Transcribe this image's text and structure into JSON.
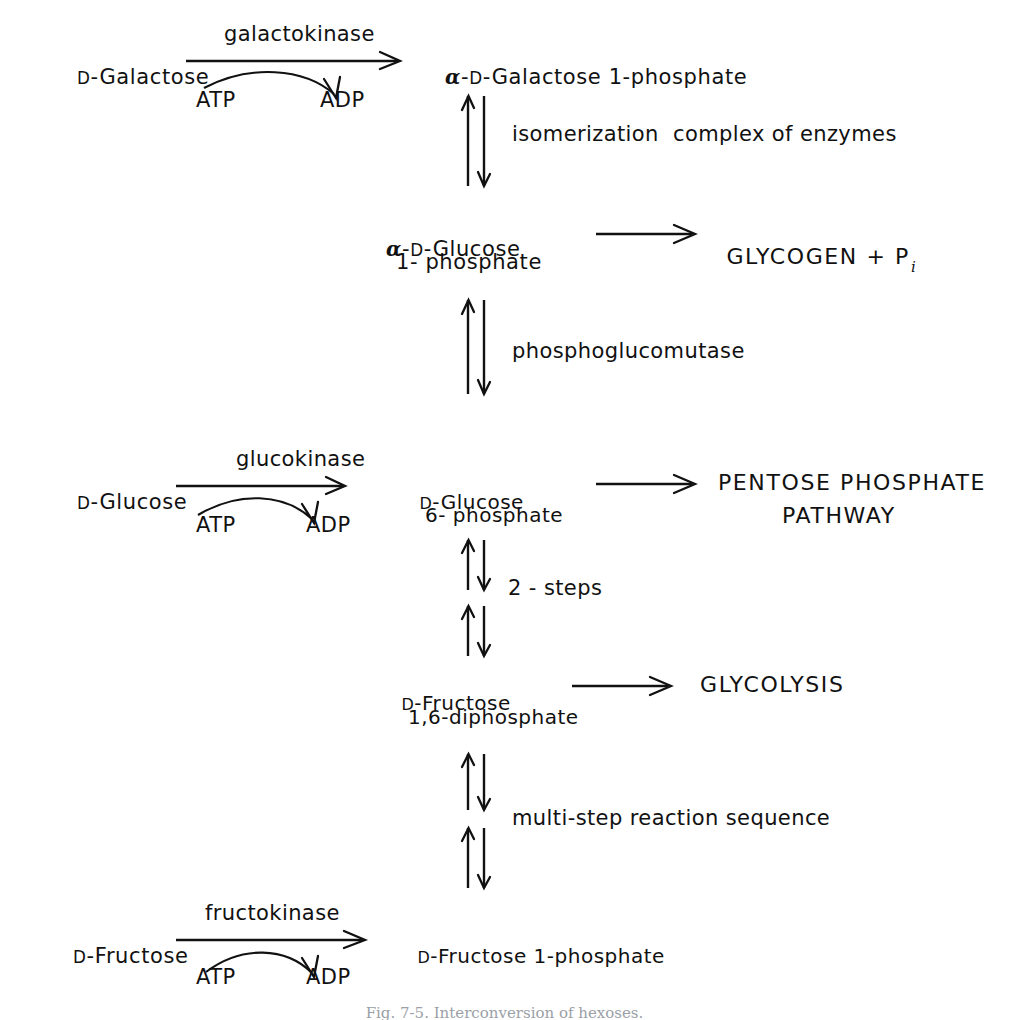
{
  "figure": {
    "caption": "Fig. 7-5. Interconversion of hexoses."
  },
  "reactions": {
    "galactokinase": {
      "substrate_prefix": "D",
      "substrate": "-Galactose",
      "enzyme": "galactokinase",
      "cofactor_in": "ATP",
      "cofactor_out": "ADP",
      "product_alpha": "α",
      "product_dash": "-",
      "product_prefix": "D",
      "product": "-Galactose 1-phosphate"
    },
    "glucokinase": {
      "substrate_prefix": "D",
      "substrate": "-Glucose",
      "enzyme": "glucokinase",
      "cofactor_in": "ATP",
      "cofactor_out": "ADP",
      "product_prefix": "D",
      "product_line1": "-Glucose",
      "product_line2": "6- phosphate"
    },
    "fructokinase": {
      "substrate_prefix": "D",
      "substrate": "-Fructose",
      "enzyme": "fructokinase",
      "cofactor_in": "ATP",
      "cofactor_out": "ADP",
      "product_prefix": "D",
      "product": "-Fructose 1-phosphate"
    }
  },
  "intermediates": {
    "glucose_1_phosphate": {
      "alpha": "α",
      "dash": "-",
      "prefix": "D",
      "line1": "-Glucose",
      "line2": "1- phosphate"
    },
    "fructose_16_diphosphate": {
      "prefix": "D",
      "line1": "-Fructose",
      "line2": "1,6-diphosphate"
    }
  },
  "steps": {
    "isomerization": "isomerization  complex of enzymes",
    "phosphoglucomutase": "phosphoglucomutase",
    "two_steps": "2 - steps",
    "multi_step": "multi-step reaction sequence"
  },
  "outputs": {
    "glycogen": "GLYCOGEN + P",
    "glycogen_subscript": "i",
    "pentose_line1": "PENTOSE PHOSPHATE",
    "pentose_line2": "PATHWAY",
    "glycolysis": "GLYCOLYSIS"
  },
  "colors": {
    "ink": "#111111",
    "background": "#ffffff",
    "caption": "#9aa0a6"
  }
}
